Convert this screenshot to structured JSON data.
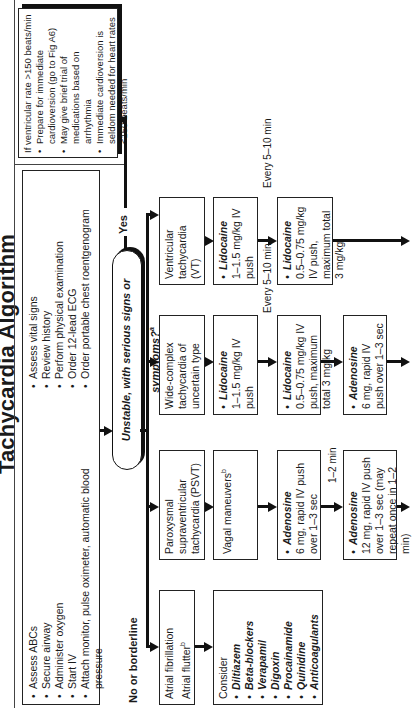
{
  "title": "Tachycardia Algorithm",
  "initial_box": {
    "left_items": [
      "Assess ABCs",
      "Secure airway",
      "Administer oxygen",
      "Start IV",
      "Attach monitor, pulse oximeter, automatic blood pressure"
    ],
    "right_items": [
      "Assess vital signs",
      "Review history",
      "Perform physical examination",
      "Order 12-lead ECG",
      "Order portable chest roentgenogram"
    ]
  },
  "decision": {
    "text": "Unstable, with serious signs or symptoms?",
    "footnote": "a"
  },
  "yes_label": "Yes",
  "no_label": "No or borderline",
  "unstable_box": {
    "heading": "If ventricular rate >150 beats/min",
    "items": [
      "Prepare for immediate cardioversion (go to Fig A6)",
      "May give brief trial of medications based on arrhythmia",
      "Immediate cardioversion is seldom needed for heart rates <150 beats/min"
    ]
  },
  "columns": {
    "af": {
      "heading_line1": "Atrial fibrillation",
      "heading_line2": "Atrial flutter",
      "heading_footnote": "b",
      "consider_label": "Consider",
      "drugs": [
        "Diltiazem",
        "Beta-blockers",
        "Verapamil",
        "Digoxin",
        "Procainamide",
        "Quinidine",
        "Anticoagulants"
      ]
    },
    "psvt": {
      "heading": "Paroxysmal supraventricular tachycardia (PSVT)",
      "step1": "Vagal maneuvers",
      "step1_footnote": "b",
      "step2_drug": "Adenosine",
      "step2_text": "6 mg, rapid IV push over 1–3 sec",
      "interval": "1–2 min",
      "step3_drug": "Adenosine",
      "step3_text": "12 mg, rapid IV push over 1–3 sec (may repeat once in 1–2 min)"
    },
    "wide": {
      "heading": "Wide-complex tachycardia of uncertain type",
      "step1_drug": "Lidocaine",
      "step1_text": "1–1.5 mg/kg IV push",
      "interval": "Every 5–10 min",
      "step2_drug": "Lidocaine",
      "step2_text": "0.5–0.75 mg/kg IV push, maximum total 3 mg/kg",
      "step3_drug": "Adenosine",
      "step3_text": "6 mg, rapid IV push over 1–3 sec"
    },
    "vt": {
      "heading": "Ventricular tachycardia (VT)",
      "step1_drug": "Lidocaine",
      "step1_text": "1–1.5 mg/kg IV push",
      "interval": "Every 5–10 min",
      "step2_drug": "Lidocaine",
      "step2_text": "0.5–0.75 mg/kg IV push, maximum total 3 mg/kg"
    }
  }
}
